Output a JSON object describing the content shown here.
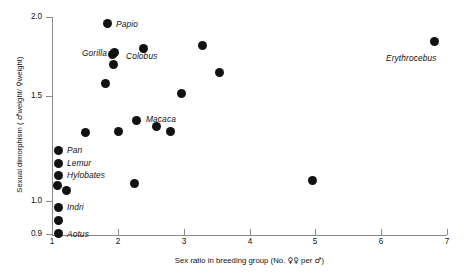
{
  "chart": {
    "type": "scatter",
    "title": "",
    "xlabel_parts": {
      "pre": "Sex ratio in breeding group (No. ",
      "female": "♀♀",
      "mid": " per ",
      "male": "♂",
      "post": ")"
    },
    "xlabel": "Sex ratio in breeding group (No. ♀♀ per ♂)",
    "ylabel_parts": {
      "pre": "Sexual dimorphism ( ",
      "male": "♂",
      "mid": "weight/ ",
      "female": "♀",
      "post": "weight)"
    },
    "ylabel": "Sexual dimorphism ( ♂weight/ ♀weight)",
    "marker_color": "#121212",
    "axis_color": "#8a8a8a"
  },
  "chart_data": {
    "type": "scatter",
    "title": "",
    "xlabel": "Sex ratio in breeding group (No. ♀♀ per ♂)",
    "ylabel": "Sexual dimorphism ( ♂weight/ ♀weight)",
    "xlim": [
      1,
      7
    ],
    "ylim": [
      0.9,
      2.0
    ],
    "xticks": [
      "1",
      "2",
      "3",
      "4",
      "5",
      "6",
      "7"
    ],
    "yticks": [
      "2.0",
      "1.5",
      "1.0",
      "0.9"
    ],
    "grid": false,
    "legend": "none",
    "points": [
      {
        "label": "Papio",
        "x": 1.83,
        "y": 1.98,
        "px": 107,
        "py": 23,
        "lx": 116,
        "ly": 19
      },
      {
        "label": "",
        "x": 2.46,
        "y": 1.85,
        "px": 143,
        "py": 48
      },
      {
        "label": "Gorilla",
        "x": 1.95,
        "y": 1.75,
        "px": 114,
        "py": 52,
        "lx": 82,
        "ly": 48
      },
      {
        "label": "",
        "x": 1.92,
        "y": 1.74,
        "px": 112,
        "py": 54
      },
      {
        "label": "Colobus",
        "x": 1.9,
        "y": 1.67,
        "px": 113,
        "py": 64,
        "lx": 126,
        "ly": 51
      },
      {
        "label": "",
        "x": 3.38,
        "y": 1.81,
        "px": 202,
        "py": 45
      },
      {
        "label": "Erythrocebus",
        "x": 6.96,
        "y": 1.86,
        "px": 434,
        "py": 41,
        "lx": 386,
        "ly": 53
      },
      {
        "label": "",
        "x": 3.62,
        "y": 1.61,
        "px": 219,
        "py": 72
      },
      {
        "label": "",
        "x": 1.8,
        "y": 1.55,
        "px": 105,
        "py": 83
      },
      {
        "label": "",
        "x": 2.98,
        "y": 1.49,
        "px": 181,
        "py": 93
      },
      {
        "label": "Macaca",
        "x": 2.27,
        "y": 1.34,
        "px": 136,
        "py": 120,
        "lx": 146,
        "ly": 114
      },
      {
        "label": "",
        "x": 2.58,
        "y": 1.31,
        "px": 156,
        "py": 126
      },
      {
        "label": "",
        "x": 2.0,
        "y": 1.28,
        "px": 118,
        "py": 131
      },
      {
        "label": "",
        "x": 2.82,
        "y": 1.28,
        "px": 170,
        "py": 131
      },
      {
        "label": "",
        "x": 1.48,
        "y": 1.28,
        "px": 85,
        "py": 132
      },
      {
        "label": "Pan",
        "x": 1.06,
        "y": 1.22,
        "px": 58,
        "py": 150,
        "lx": 67,
        "ly": 145
      },
      {
        "label": "Lemur",
        "x": 1.05,
        "y": 1.19,
        "px": 58,
        "py": 163,
        "lx": 67,
        "ly": 158
      },
      {
        "label": "Hylobates",
        "x": 1.05,
        "y": 1.16,
        "px": 58,
        "py": 175,
        "lx": 67,
        "ly": 170
      },
      {
        "label": "",
        "x": 1.04,
        "y": 1.13,
        "px": 57,
        "py": 185
      },
      {
        "label": "",
        "x": 1.2,
        "y": 1.11,
        "px": 66,
        "py": 190
      },
      {
        "label": "",
        "x": 2.23,
        "y": 1.14,
        "px": 134,
        "py": 183
      },
      {
        "label": "",
        "x": 4.96,
        "y": 1.17,
        "px": 312,
        "py": 180
      },
      {
        "label": "Indri",
        "x": 1.06,
        "y": 1.0,
        "px": 58,
        "py": 207,
        "lx": 67,
        "ly": 202
      },
      {
        "label": "",
        "x": 1.05,
        "y": 0.96,
        "px": 58,
        "py": 220
      },
      {
        "label": "Aotus",
        "x": 1.06,
        "y": 0.91,
        "px": 58,
        "py": 233,
        "lx": 67,
        "ly": 229
      }
    ],
    "xtick_px": [
      52,
      118,
      184,
      250,
      315,
      381,
      447
    ],
    "ytick_py": [
      17,
      96,
      201,
      234
    ]
  }
}
